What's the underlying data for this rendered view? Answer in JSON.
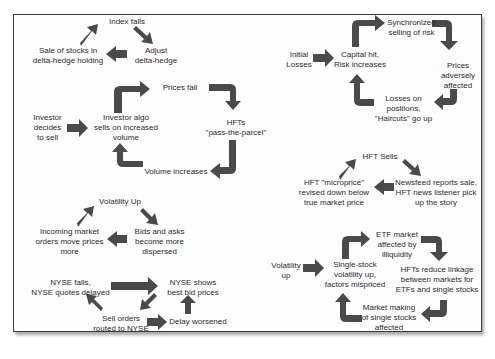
{
  "diagram": {
    "title": "",
    "colors": {
      "arrow": "#4a4a4a",
      "text": "#2b2b2b",
      "frame": "#3a3a3a",
      "background": "#fdfdfd"
    },
    "loops": [
      {
        "id": "delta-hedge-loop",
        "nodes": [
          {
            "id": "index-falls",
            "label": "Index falls"
          },
          {
            "id": "adjust-delta-hedge",
            "label": "Adjust\ndelta-hedge"
          },
          {
            "id": "sale-of-stocks",
            "label": "Sale of stocks in\ndelta-hedge holding"
          }
        ],
        "edges": [
          [
            "index-falls",
            "adjust-delta-hedge"
          ],
          [
            "adjust-delta-hedge",
            "sale-of-stocks"
          ],
          [
            "sale-of-stocks",
            "index-falls"
          ]
        ]
      },
      {
        "id": "investor-algo-loop",
        "nodes": [
          {
            "id": "investor-decides",
            "label": "Investor\ndecides\nto sell"
          },
          {
            "id": "investor-algo",
            "label": "Investor algo\nsells on increased\nvolume"
          },
          {
            "id": "prices-fall",
            "label": "Prices fall"
          },
          {
            "id": "hfts-pass",
            "label": "HFTs\n\"pass-the-parcel\""
          },
          {
            "id": "volume-increases",
            "label": "Volume increases"
          }
        ],
        "edges": [
          [
            "investor-decides",
            "investor-algo"
          ],
          [
            "investor-algo",
            "prices-fall"
          ],
          [
            "prices-fall",
            "hfts-pass"
          ],
          [
            "hfts-pass",
            "volume-increases"
          ],
          [
            "volume-increases",
            "investor-algo"
          ]
        ]
      },
      {
        "id": "volatility-loop",
        "nodes": [
          {
            "id": "volatility-up",
            "label": "Volatility Up"
          },
          {
            "id": "bids-asks",
            "label": "Bids and asks\nbecome more\ndispersed"
          },
          {
            "id": "incoming-orders",
            "label": "Incoming market\norders move prices\nmore"
          }
        ],
        "edges": [
          [
            "volatility-up",
            "bids-asks"
          ],
          [
            "bids-asks",
            "incoming-orders"
          ],
          [
            "incoming-orders",
            "volatility-up"
          ]
        ]
      },
      {
        "id": "nyse-loop",
        "nodes": [
          {
            "id": "nyse-falls",
            "label": "NYSE falls,\nNYSE quotes delayed"
          },
          {
            "id": "nyse-shows",
            "label": "NYSE shows\nbest bid prices"
          },
          {
            "id": "sell-orders",
            "label": "Sell orders\nrouted to NYSE"
          },
          {
            "id": "delay-worsened",
            "label": "Delay worsened"
          }
        ],
        "edges": [
          [
            "nyse-falls",
            "nyse-shows"
          ],
          [
            "nyse-shows",
            "sell-orders"
          ],
          [
            "sell-orders",
            "delay-worsened"
          ],
          [
            "delay-worsened",
            "nyse-shows"
          ],
          [
            "sell-orders",
            "nyse-falls"
          ]
        ]
      },
      {
        "id": "risk-loop",
        "nodes": [
          {
            "id": "initial-losses",
            "label": "Initial\nLosses"
          },
          {
            "id": "capital-hit",
            "label": "Capital hit,\nRisk increases"
          },
          {
            "id": "synchronized-selling",
            "label": "Synchronized\nselling of risk"
          },
          {
            "id": "prices-adversely",
            "label": "Prices\nadversely\naffected"
          },
          {
            "id": "losses-on-positions",
            "label": "Losses on\npositions,\n\"Haircuts\" go up"
          }
        ],
        "edges": [
          [
            "initial-losses",
            "capital-hit"
          ],
          [
            "capital-hit",
            "synchronized-selling"
          ],
          [
            "synchronized-selling",
            "prices-adversely"
          ],
          [
            "prices-adversely",
            "losses-on-positions"
          ],
          [
            "losses-on-positions",
            "capital-hit"
          ]
        ]
      },
      {
        "id": "hft-news-loop",
        "nodes": [
          {
            "id": "hft-sells",
            "label": "HFT Sells"
          },
          {
            "id": "newsfeed",
            "label": "Newsfeed reports sale,\nHFT news listener pick\nup the story"
          },
          {
            "id": "microprice",
            "label": "HFT \"microprice\"\nrevised down below\ntrue market price"
          }
        ],
        "edges": [
          [
            "hft-sells",
            "newsfeed"
          ],
          [
            "newsfeed",
            "microprice"
          ],
          [
            "microprice",
            "hft-sells"
          ]
        ]
      },
      {
        "id": "etf-loop",
        "nodes": [
          {
            "id": "volatility-up-2",
            "label": "Volatility\nup"
          },
          {
            "id": "single-stock-vol",
            "label": "Single-stock\nvolatility up,\nfactors mispriced"
          },
          {
            "id": "etf-market",
            "label": "ETF market\naffected by\nilliquidity"
          },
          {
            "id": "hfts-reduce",
            "label": "HFTs reduce linkage\nbetween markets for\nETFs and single stocks"
          },
          {
            "id": "market-making",
            "label": "Market making\nof single stocks\naffected"
          }
        ],
        "edges": [
          [
            "volatility-up-2",
            "single-stock-vol"
          ],
          [
            "single-stock-vol",
            "etf-market"
          ],
          [
            "etf-market",
            "hfts-reduce"
          ],
          [
            "hfts-reduce",
            "market-making"
          ],
          [
            "market-making",
            "single-stock-vol"
          ]
        ]
      }
    ]
  },
  "labels": {
    "index_falls": "Index falls",
    "adjust_delta_hedge": "Adjust\ndelta-hedge",
    "sale_of_stocks": "Sale of stocks in\ndelta-hedge holding",
    "investor_decides": "Investor\ndecides\nto sell",
    "investor_algo": "Investor algo\nsells on increased\nvolume",
    "prices_fall": "Prices fall",
    "hfts_pass": "HFTs\n\"pass-the-parcel\"",
    "volume_increases": "Volume increases",
    "volatility_up": "Volatility Up",
    "bids_asks": "Bids and asks\nbecome more\ndispersed",
    "incoming_orders": "Incoming market\norders move prices\nmore",
    "nyse_falls": "NYSE falls,\nNYSE quotes delayed",
    "nyse_shows": "NYSE shows\nbest bid prices",
    "sell_orders": "Sell orders\nrouted to NYSE",
    "delay_worsened": "Delay worsened",
    "initial_losses": "Initial\nLosses",
    "capital_hit": "Capital hit,\nRisk increases",
    "synchronized_selling": "Synchronized\nselling of risk",
    "prices_adversely": "Prices\nadversely\naffected",
    "losses_on_positions": "Losses on\npositions,\n\"Haircuts\" go up",
    "hft_sells": "HFT Sells",
    "newsfeed": "Newsfeed reports sale,\nHFT news listener pick\nup the story",
    "microprice": "HFT \"microprice\"\nrevised down below\ntrue market price",
    "volatility_up_2": "Volatility\nup",
    "single_stock_vol": "Single-stock\nvolatility up,\nfactors mispriced",
    "etf_market": "ETF market\naffected by\nilliquidity",
    "hfts_reduce": "HFTs reduce linkage\nbetween markets for\nETFs and single stocks",
    "market_making": "Market making\nof single stocks\naffected"
  }
}
